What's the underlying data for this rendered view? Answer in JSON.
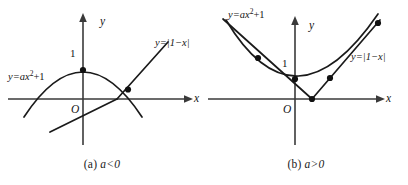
{
  "figure": {
    "width": 408,
    "height": 185,
    "background": "#ffffff",
    "stroke_color": "#1a1a1a",
    "axis_color": "#3a3a3a"
  },
  "panels": [
    {
      "id": "a",
      "caption": "(a) a<0",
      "caption_prefix": "(a) ",
      "caption_condition": "a<0",
      "axes": {
        "x_label": "x",
        "y_label": "y",
        "origin_label": "O",
        "y_tick_label": "1"
      },
      "curves": [
        {
          "name": "parabola",
          "label": "y=ax",
          "label_exponent": "2",
          "label_suffix": "+1",
          "full_label": "y=ax2+1",
          "shape": "downward-parabola",
          "vertex": [
            0,
            1
          ]
        },
        {
          "name": "absolute-value",
          "label": "y=|1−x|",
          "shape": "v-shape",
          "vertex": [
            1,
            0
          ]
        }
      ],
      "intersections": [
        {
          "x": 0,
          "y": 1
        },
        {
          "x": 1.45,
          "y": 0.45
        }
      ]
    },
    {
      "id": "b",
      "caption": "(b) a>0",
      "caption_prefix": "(b) ",
      "caption_condition": "a>0",
      "axes": {
        "x_label": "x",
        "y_label": "y",
        "origin_label": "O",
        "y_tick_label": "1"
      },
      "curves": [
        {
          "name": "parabola",
          "label": "y=ax",
          "label_exponent": "2",
          "label_suffix": "+1",
          "full_label": "y=ax2+1",
          "shape": "upward-parabola",
          "vertex": [
            0,
            1
          ]
        },
        {
          "name": "absolute-value",
          "label": "y=|1−x|",
          "shape": "v-shape",
          "vertex": [
            1,
            0
          ]
        }
      ],
      "intersections": [
        {
          "x": -2.1,
          "y": 3.1
        },
        {
          "x": 0,
          "y": 1
        },
        {
          "x": 1.9,
          "y": 0.9
        },
        {
          "x": 3.6,
          "y": 4.6
        }
      ]
    }
  ]
}
